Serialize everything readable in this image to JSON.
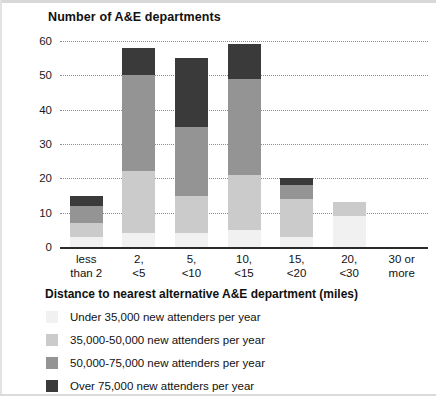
{
  "chart_data": {
    "type": "bar",
    "subtype": "stacked-vertical",
    "title": "Number of A&E departments",
    "xlabel": "Distance to nearest alternative A&E department (miles)",
    "ylabel": "Number of A&E departments",
    "ylim": [
      0,
      60
    ],
    "yticks": [
      0,
      10,
      20,
      30,
      40,
      50,
      60
    ],
    "grid": "horizontal-dotted",
    "legend_position": "bottom-left",
    "categories": [
      "less than 2",
      "2, <5",
      "5, <10",
      "10, <15",
      "15, <20",
      "20, <30",
      "30 or more"
    ],
    "category_lines": [
      [
        "less",
        "than 2"
      ],
      [
        "2,",
        "<5"
      ],
      [
        "5,",
        "<10"
      ],
      [
        "10,",
        "<15"
      ],
      [
        "15,",
        "<20"
      ],
      [
        "20,",
        "<30"
      ],
      [
        "30 or",
        "more"
      ]
    ],
    "series": [
      {
        "name": "Under 35,000 new attenders per year",
        "color": "#f1f1f1",
        "values": [
          3,
          4,
          4,
          5,
          3,
          9,
          0
        ]
      },
      {
        "name": "35,000-50,000 new attenders per year",
        "color": "#cbcbcb",
        "values": [
          4,
          18,
          11,
          16,
          11,
          4,
          0
        ]
      },
      {
        "name": "50,000-75,000 new attenders per year",
        "color": "#949494",
        "values": [
          5,
          28,
          20,
          28,
          4,
          0,
          0
        ]
      },
      {
        "name": "Over 75,000 new attenders per year",
        "color": "#3a3a3a",
        "values": [
          3,
          8,
          20,
          10,
          2,
          0,
          0
        ]
      }
    ],
    "totals": [
      15,
      58,
      55,
      59,
      20,
      13,
      0
    ]
  },
  "legend": {
    "items": [
      {
        "label": "Under 35,000 new attenders per year",
        "color": "#f1f1f1"
      },
      {
        "label": "35,000-50,000 new attenders per year",
        "color": "#cbcbcb"
      },
      {
        "label": "50,000-75,000 new attenders per year",
        "color": "#949494"
      },
      {
        "label": "Over 75,000 new attenders per year",
        "color": "#3a3a3a"
      }
    ]
  }
}
